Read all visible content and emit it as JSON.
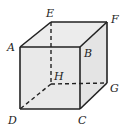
{
  "diagram": {
    "type": "cube",
    "colors": {
      "background": "#ffffff",
      "face_fill": "#e9e9e9",
      "edge": "#222222"
    },
    "vertices": {
      "A": {
        "x": 20,
        "y": 47,
        "label": "A",
        "lx": 7,
        "ly": 51
      },
      "B": {
        "x": 80,
        "y": 47,
        "label": "B",
        "lx": 84,
        "ly": 57
      },
      "C": {
        "x": 80,
        "y": 109,
        "label": "C",
        "lx": 78,
        "ly": 124
      },
      "D": {
        "x": 20,
        "y": 109,
        "label": "D",
        "lx": 8,
        "ly": 124
      },
      "E": {
        "x": 51,
        "y": 22,
        "label": "E",
        "lx": 46,
        "ly": 17
      },
      "F": {
        "x": 107,
        "y": 22,
        "label": "F",
        "lx": 111,
        "ly": 23
      },
      "G": {
        "x": 107,
        "y": 83,
        "label": "G",
        "lx": 110,
        "ly": 92
      },
      "H": {
        "x": 51,
        "y": 84,
        "label": "H",
        "lx": 54,
        "ly": 80
      }
    },
    "solid_edges": [
      "AB",
      "BC",
      "CD",
      "DA",
      "AE",
      "EF",
      "FB",
      "FG",
      "GC"
    ],
    "hidden_edges": [
      "EH",
      "HG",
      "HD"
    ]
  }
}
